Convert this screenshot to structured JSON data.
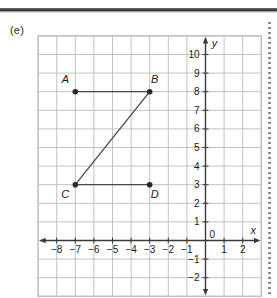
{
  "figure": {
    "part_label": "(e)",
    "axis_labels": {
      "x": "x",
      "y": "y"
    },
    "x_ticks": [
      "-8",
      "-7",
      "-6",
      "-5",
      "-4",
      "-3",
      "-2",
      "-1",
      "0",
      "1",
      "2"
    ],
    "x_tick_values": [
      -8,
      -7,
      -6,
      -5,
      -4,
      -3,
      -2,
      -1,
      0,
      1,
      2
    ],
    "y_ticks": [
      "10",
      "9",
      "8",
      "7",
      "6",
      "5",
      "4",
      "3",
      "2",
      "1",
      "-1",
      "-2"
    ],
    "y_tick_values": [
      10,
      9,
      8,
      7,
      6,
      5,
      4,
      3,
      2,
      1,
      -1,
      -2
    ],
    "origin_label": "0",
    "colors": {
      "grid": "#b9bcc0",
      "axis": "#3a3a3a",
      "point": "#2a2a2a",
      "segment": "#4a4a4a",
      "text": "#1a1a1a",
      "rule": "#3a3d41"
    },
    "points": [
      {
        "name": "A",
        "x": -7,
        "y": 8,
        "label_dx": -10,
        "label_dy": -9
      },
      {
        "name": "B",
        "x": -3,
        "y": 8,
        "label_dx": 5,
        "label_dy": -9
      },
      {
        "name": "C",
        "x": -7,
        "y": 3,
        "label_dx": -10,
        "label_dy": 13
      },
      {
        "name": "D",
        "x": -3,
        "y": 3,
        "label_dx": 5,
        "label_dy": 13
      }
    ],
    "segments": [
      {
        "from": "A",
        "to": "B"
      },
      {
        "from": "C",
        "to": "B"
      },
      {
        "from": "C",
        "to": "D"
      }
    ],
    "grid": {
      "x_min": -9,
      "x_max": 3,
      "y_min": -3,
      "y_max": 11,
      "cell_px": 18.6,
      "show_grid": true
    }
  }
}
